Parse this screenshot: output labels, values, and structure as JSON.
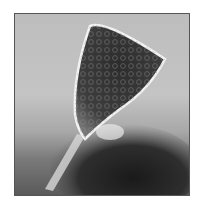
{
  "image": {
    "subject": "micrograph of trumpet-shaped ciliate protist",
    "colors": {
      "background": "#bdbdbd",
      "cell_body": "#3a3a3a",
      "cell_outline": "#f0f0f0",
      "dark_mass": "#222222",
      "border": "#555555"
    }
  }
}
